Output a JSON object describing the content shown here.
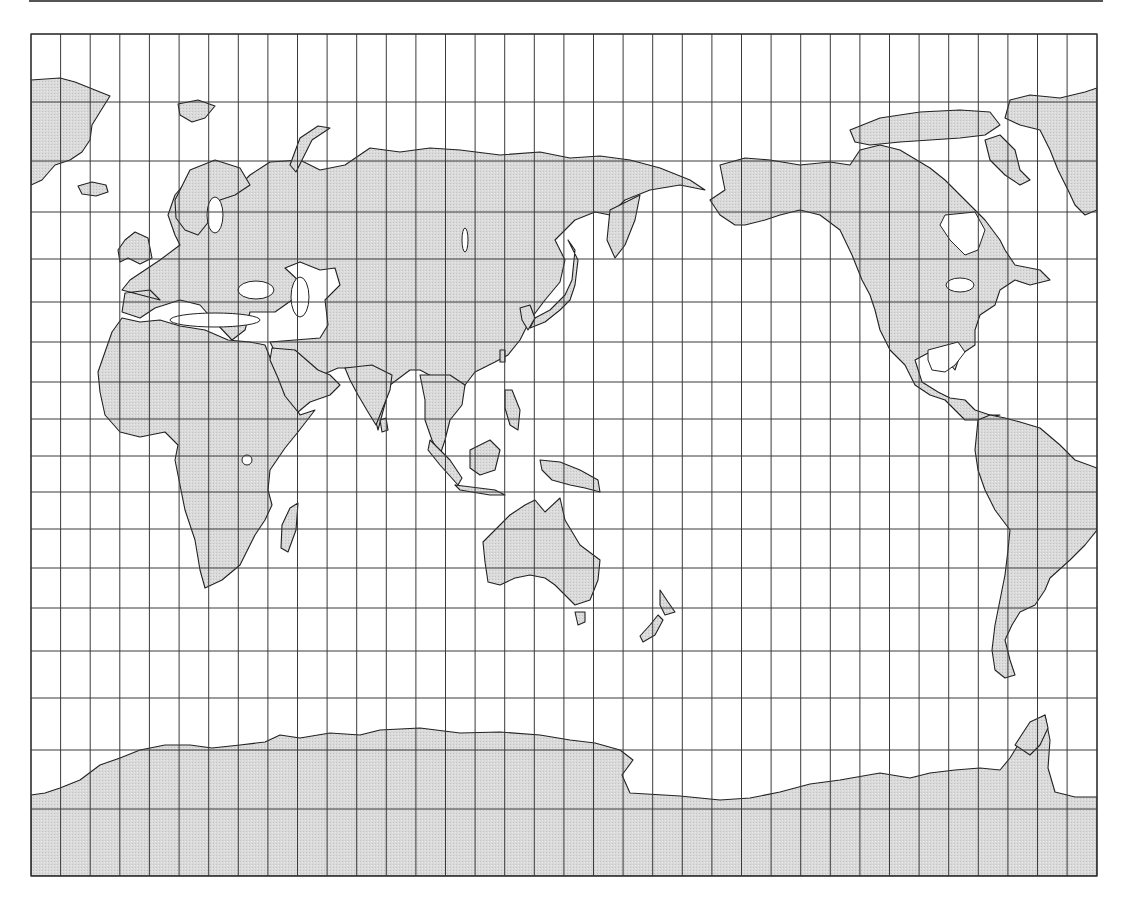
{
  "map": {
    "projection": "Miller cylindrical (Pacific-centered)",
    "graticule_step_deg": 10,
    "colors": {
      "land_fill": "#d9d9d9",
      "land_stipple": "#c4c4c4",
      "coastline": "#222222",
      "grid": "#3a3a3a",
      "ocean": "#ffffff"
    },
    "frame": {
      "x": 31,
      "y": 34,
      "width": 1066,
      "height": 842
    },
    "meridian_x": [
      31,
      60.6,
      90.2,
      119.8,
      149.4,
      179.1,
      208.7,
      238.3,
      267.9,
      297.5,
      327.1,
      356.7,
      386.3,
      415.9,
      445.5,
      475.1,
      504.7,
      534.3,
      563.9,
      593.5,
      623.1,
      652.7,
      682.3,
      711.9,
      741.5,
      771.1,
      800.7,
      830.3,
      859.9,
      889.5,
      919.1,
      948.7,
      978.3,
      1007.9,
      1037.5,
      1067.1,
      1097
    ],
    "parallel_y": [
      34,
      102,
      161,
      212,
      259,
      302,
      342,
      382,
      419,
      456,
      492,
      529,
      568,
      608,
      651,
      698,
      750,
      809,
      876
    ],
    "landmasses": [
      {
        "name": "greenland-west",
        "d": "M31,80 L60,78 L75,82 L95,90 L110,96 L100,112 L92,125 L90,140 L82,152 L70,160 L55,165 L42,180 L31,185 Z"
      },
      {
        "name": "greenland-east",
        "d": "M1010,100 L1030,95 L1060,98 L1085,92 L1097,88 L1097,210 L1085,215 L1075,205 L1068,190 L1058,170 L1050,150 L1040,130 L1020,125 L1005,118 Z"
      },
      {
        "name": "iceland",
        "d": "M78,186 L92,182 L106,185 L108,192 L96,196 L82,194 Z"
      },
      {
        "name": "eurasia",
        "d": "M160,300 L150,290 L125,293 L122,312 L140,318 L155,308 L180,300 L200,305 L215,322 L232,340 L245,330 L250,312 L275,312 L292,300 L300,282 L285,268 L300,262 L320,270 L335,268 L340,285 L325,300 L328,325 L320,338 L270,342 L275,352 L300,366 L305,380 L295,402 L315,378 L338,368 L355,368 L368,390 L378,430 L390,385 L410,370 L420,370 L435,378 L445,410 L458,405 L465,385 L475,372 L495,362 L508,355 L520,340 L530,320 L545,300 L560,282 L565,260 L555,240 L575,220 L595,212 L610,215 L625,200 L650,190 L680,185 L705,190 L690,180 L660,168 L630,160 L600,156 L570,158 L540,152 L500,155 L460,150 L430,148 L400,152 L370,148 L345,165 L320,170 L300,160 L270,162 L250,175 L240,185 L228,175 L210,165 L192,175 L175,195 L168,215 L175,235 L180,245 L160,260 L148,268 L130,280 L122,290 Z"
      },
      {
        "name": "scandinavia-fill",
        "d": "M175,200 L190,170 L215,160 L240,168 L250,185 L235,195 L220,200 L210,220 L198,235 L185,230 L176,218 Z"
      },
      {
        "name": "britain",
        "d": "M125,240 L135,232 L148,238 L152,258 L140,264 L128,258 L120,262 L118,250 Z"
      },
      {
        "name": "novaya-zemlya",
        "d": "M290,165 L300,138 L318,126 L330,128 L312,140 L302,160 L296,172 Z"
      },
      {
        "name": "svalbard",
        "d": "M178,104 L198,100 L215,106 L205,118 L192,122 L180,115 Z"
      },
      {
        "name": "africa",
        "d": "M122,318 L140,322 L160,320 L180,326 L205,330 L228,340 L250,342 L265,345 L275,370 L290,398 L300,415 L315,410 L298,432 L285,448 L270,470 L268,490 L272,505 L265,520 L255,535 L240,565 L222,580 L205,588 L200,570 L195,540 L185,510 L180,485 L175,460 L178,445 L165,432 L140,437 L120,432 L105,415 L100,392 L98,372 L105,352 L112,332 Z"
      },
      {
        "name": "arabia",
        "d": "M272,348 L295,350 L318,370 L330,375 L340,385 L330,395 L310,402 L298,412 L285,396 L278,378 L270,360 Z"
      },
      {
        "name": "madagascar",
        "d": "M290,508 L298,503 L296,530 L288,552 L281,548 L282,525 Z"
      },
      {
        "name": "india",
        "d": "M345,368 L372,365 L392,375 L390,390 L382,410 L376,425 L368,412 L358,395 L350,380 Z"
      },
      {
        "name": "sri-lanka",
        "d": "M380,420 L386,418 L388,430 L382,432 Z"
      },
      {
        "name": "indochina",
        "d": "M420,375 L450,375 L465,385 L462,405 L450,420 L445,440 L440,455 L432,440 L425,420 L425,400 Z"
      },
      {
        "name": "sumatra",
        "d": "M430,440 L450,460 L462,478 L458,485 L440,465 L428,450 Z"
      },
      {
        "name": "java",
        "d": "M455,485 L495,490 L505,495 L490,495 L460,490 Z"
      },
      {
        "name": "borneo",
        "d": "M470,450 L490,440 L500,450 L495,470 L480,475 L470,468 Z"
      },
      {
        "name": "new-guinea",
        "d": "M540,460 L560,462 L580,470 L598,480 L600,492 L585,488 L570,485 L552,480 L542,470 Z"
      },
      {
        "name": "philippines",
        "d": "M505,390 L512,390 L520,410 L518,430 L510,425 L505,408 Z"
      },
      {
        "name": "japan",
        "d": "M568,240 L575,250 L572,280 L565,295 L550,310 L535,318 L530,328 L545,322 L560,310 L570,300 L575,285 L578,260 Z"
      },
      {
        "name": "taiwan",
        "d": "M500,350 L505,350 L505,362 L500,362 Z"
      },
      {
        "name": "kamchatka",
        "d": "M610,210 L630,200 L640,195 L635,220 L625,245 L615,258 L607,240 Z"
      },
      {
        "name": "korea",
        "d": "M520,308 L530,305 L535,318 L528,330 L522,320 Z"
      },
      {
        "name": "australia",
        "d": "M490,535 L510,515 L525,505 L535,500 L545,512 L560,498 L565,520 L580,545 L600,560 L598,580 L590,600 L575,605 L565,595 L555,585 L545,578 L530,575 L515,578 L500,585 L488,582 L485,562 L483,542 Z"
      },
      {
        "name": "tasmania",
        "d": "M575,612 L585,612 L585,622 L578,625 Z"
      },
      {
        "name": "new-zealand-n",
        "d": "M660,590 L668,602 L675,612 L665,615 L660,605 Z"
      },
      {
        "name": "new-zealand-s",
        "d": "M658,615 L663,620 L655,635 L643,642 L640,636 L650,625 Z"
      },
      {
        "name": "north-america",
        "d": "M720,165 L745,158 L770,160 L800,165 L830,162 L850,165 L860,150 L880,145 L900,150 L930,168 L945,180 L960,195 L975,210 L985,220 L1000,240 L1005,250 L1015,265 L1040,270 L1050,280 L1030,285 L1015,280 L1000,290 L995,305 L980,315 L975,330 L975,345 L960,355 L955,370 L945,358 L930,352 L915,360 L922,382 L938,392 L950,398 L965,400 L975,410 L990,415 L1000,415 L980,420 L965,420 L955,410 L945,400 L930,395 L915,385 L905,365 L890,350 L880,330 L875,310 L870,295 L862,280 L852,255 L840,230 L820,215 L800,210 L780,215 L765,220 L745,225 L735,225 L720,215 L710,200 L725,190 Z"
      },
      {
        "name": "hudson-bay",
        "d": "M945,215 L975,212 L985,230 L978,250 L965,255 L950,240 L940,225 Z",
        "lake": true
      },
      {
        "name": "gulf-of-mexico",
        "d": "M928,350 L958,342 L965,352 L955,365 L945,372 L932,370 L928,360 Z",
        "lake": true
      },
      {
        "name": "baffin",
        "d": "M985,140 L1000,135 L1015,150 L1020,170 L1030,180 L1020,185 L1005,175 L990,160 Z"
      },
      {
        "name": "arctic-isles",
        "d": "M850,130 L880,118 L920,112 L960,110 L990,112 L1000,125 L985,135 L960,138 L930,140 L900,142 L870,145 L855,142 Z"
      },
      {
        "name": "south-america",
        "d": "M978,420 L990,415 L1005,418 L1020,422 L1040,428 L1060,445 L1075,460 L1097,468 L1097,530 L1085,545 L1070,560 L1050,578 L1045,590 L1035,605 L1020,612 L1012,625 L1005,640 L1010,660 L1015,675 L1005,678 L995,670 L992,650 L995,625 L1000,600 L1005,575 L1008,550 L1010,530 L995,510 L985,490 L978,470 L975,450 Z"
      },
      {
        "name": "antarctica",
        "d": "M31,795 L45,793 L60,788 L80,780 L100,765 L120,758 L140,750 L165,745 L190,745 L212,748 L240,745 L265,742 L280,735 L300,738 L330,733 L360,735 L380,730 L420,728 L460,733 L500,732 L540,735 L570,740 L595,743 L620,750 L633,760 L622,775 L630,793 L680,796 L720,800 L750,798 L780,792 L810,784 L840,780 L880,773 L910,778 L930,773 L955,770 L980,768 L1000,770 L1010,758 L1018,745 L1030,725 L1045,715 L1050,740 L1048,768 L1055,792 L1075,797 L1097,797 L1097,876 L31,876 Z"
      },
      {
        "name": "antarctic-peninsula",
        "d": "M1015,745 L1030,722 L1045,715 L1048,728 L1040,745 L1030,755 Z"
      }
    ],
    "lakes": [
      {
        "name": "black-sea",
        "cx": 256,
        "cy": 290,
        "rx": 18,
        "ry": 9
      },
      {
        "name": "caspian-sea",
        "cx": 300,
        "cy": 297,
        "rx": 9,
        "ry": 20
      },
      {
        "name": "baltic-sea",
        "cx": 215,
        "cy": 215,
        "rx": 8,
        "ry": 18
      },
      {
        "name": "mediterranean",
        "cx": 215,
        "cy": 320,
        "rx": 45,
        "ry": 7
      },
      {
        "name": "great-lakes",
        "cx": 960,
        "cy": 285,
        "rx": 14,
        "ry": 7
      },
      {
        "name": "lake-baikal",
        "cx": 465,
        "cy": 240,
        "rx": 3,
        "ry": 12
      },
      {
        "name": "lake-victoria",
        "cx": 247,
        "cy": 460,
        "rx": 5,
        "ry": 5
      }
    ]
  }
}
